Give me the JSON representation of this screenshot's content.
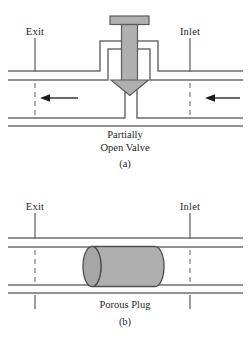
{
  "figure": {
    "panels": [
      {
        "id": "(a)",
        "caption": "Partially\nOpen Valve",
        "left_label": "Exit",
        "right_label": "Inlet",
        "device": "partially-open-valve",
        "flow_direction": "right-to-left",
        "flow_arrow_count": 2
      },
      {
        "id": "(b)",
        "caption": "Porous Plug",
        "left_label": "Exit",
        "right_label": "Inlet",
        "device": "porous-plug",
        "flow_direction": "right-to-left",
        "flow_arrow_count": 0
      }
    ]
  },
  "colors": {
    "line": "#6e6e6e",
    "dark_line": "#3c3c3c",
    "fill_gray": "#b0b0b0",
    "fill_gray_dark": "#9a9a9a",
    "background": "#ffffff",
    "text": "#1f1f1f"
  },
  "geometry": {
    "panel_a_center_x": 125,
    "panel_b_center_x": 125,
    "left_station_x": 35,
    "right_station_x": 190
  }
}
